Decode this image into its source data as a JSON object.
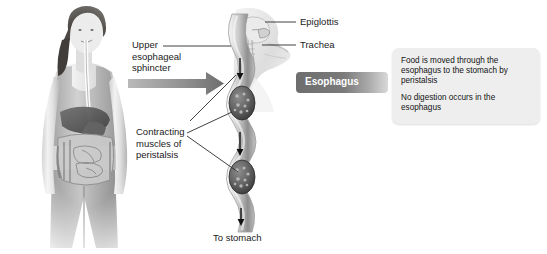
{
  "diagram": {
    "background": "#ffffff",
    "ink": "#1a1a1a"
  },
  "labels": {
    "upper_esophageal_sphincter": "Upper\nesophageal\nsphincter",
    "contracting_muscles": "Contracting\nmuscles of\nperistalsis",
    "epiglottis": "Epiglottis",
    "trachea": "Trachea",
    "to_stomach": "To stomach"
  },
  "banner": {
    "label": "Esophagus",
    "text_color": "#ffffff",
    "fill_dark": "#6e6e6e",
    "fill_light": "#d9d9d9"
  },
  "callout": {
    "background": "#eeeeee",
    "paragraph_1": "Food is moved through the esophagus to the stomach by peristalsis",
    "paragraph_2": "No digestion occurs in the esophagus"
  },
  "figures": {
    "woman_photo_alt": "grayscale photograph of a woman with digestive organs overlaid",
    "head_sagittal_alt": "sagittal section of head and neck showing epiglottis and trachea",
    "esophagus_tube_alt": "wavy esophagus tube with two food boluses and downward peristalsis arrows"
  },
  "arrows": {
    "pointer_arrow_alt": "large gray arrow pointing right toward the esophagus banner",
    "peristalsis_arrow_count": 3,
    "direction": "down"
  }
}
